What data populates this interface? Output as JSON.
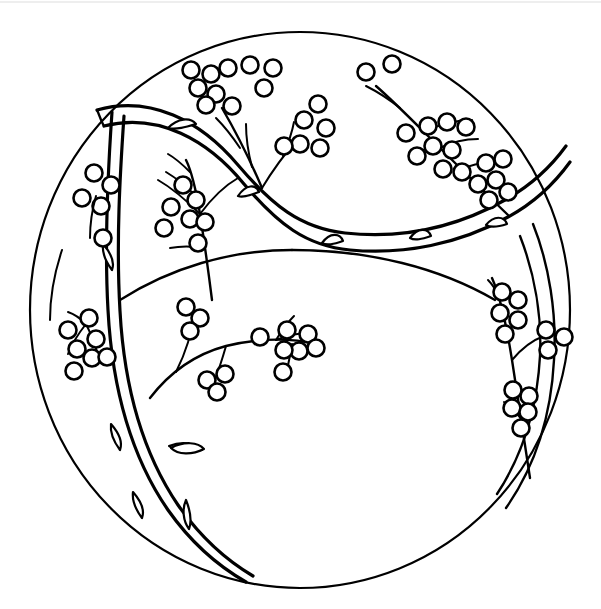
{
  "document": {
    "kind": "coloring-page-line-art",
    "title": "Berry Branch Mandala Circle",
    "width": 601,
    "height": 609,
    "background_color": "#ffffff",
    "ink_color": "#000000",
    "top_edge_color": "#e9e9e9"
  },
  "artwork": {
    "frame": {
      "shape": "circle",
      "center_x": 300,
      "center_y": 310,
      "radius_x": 270,
      "radius_y": 278,
      "stroke_width": 2.2
    },
    "description": "A large outlined circle divided by a sweeping double-line S-curved vine. Slender branches bearing clusters of small open-circle berries radiate across the three resulting regions.",
    "motifs": [
      {
        "name": "outer-circle",
        "count": 1
      },
      {
        "name": "s-curve-vine",
        "count": 1
      },
      {
        "name": "inner-arc-vine",
        "count": 2
      },
      {
        "name": "berry-branch",
        "count": 8
      },
      {
        "name": "berry",
        "count": 92
      },
      {
        "name": "thorn-spur",
        "count": 7
      },
      {
        "name": "leaf",
        "count": 3
      }
    ],
    "berry_radius": 8.5,
    "regions": [
      {
        "name": "upper-region",
        "label": "top band above the S-vine"
      },
      {
        "name": "left-region",
        "label": "left crescent between vine and rim"
      },
      {
        "name": "lower-region",
        "label": "large lower area below the S-vine"
      }
    ]
  },
  "chart_data": {
    "type": "scatter",
    "xlabel": "",
    "ylabel": "",
    "xlim": [
      0,
      601
    ],
    "ylim": [
      0,
      609
    ],
    "grid": false,
    "legend": "none",
    "series": [
      {
        "name": "berry-clusters",
        "values": [
          {
            "cluster": "upper-left-cluster",
            "x": 210,
            "y": 75,
            "berries": 7
          },
          {
            "cluster": "upper-mid-cluster",
            "x": 262,
            "y": 68,
            "berries": 3
          },
          {
            "cluster": "upper-center-cluster",
            "x": 312,
            "y": 128,
            "berries": 6
          },
          {
            "cluster": "upper-right-pair",
            "x": 370,
            "y": 67,
            "berries": 2
          },
          {
            "cluster": "right-upper-cluster",
            "x": 430,
            "y": 135,
            "berries": 8
          },
          {
            "cluster": "right-edge-cluster",
            "x": 492,
            "y": 178,
            "berries": 6
          },
          {
            "cluster": "left-top-cluster",
            "x": 93,
            "y": 180,
            "berries": 4
          },
          {
            "cluster": "left-mid-cluster",
            "x": 185,
            "y": 200,
            "berries": 7
          },
          {
            "cluster": "left-low-cluster",
            "x": 80,
            "y": 345,
            "berries": 7
          },
          {
            "cluster": "center-left-cluster",
            "x": 190,
            "y": 315,
            "berries": 4
          },
          {
            "cluster": "center-cluster",
            "x": 220,
            "y": 380,
            "berries": 3
          },
          {
            "cluster": "center-right-cluster",
            "x": 290,
            "y": 345,
            "berries": 7
          },
          {
            "cluster": "right-mid-cluster",
            "x": 510,
            "y": 300,
            "berries": 7
          },
          {
            "cluster": "right-low-cluster",
            "x": 548,
            "y": 345,
            "berries": 4
          },
          {
            "cluster": "right-bottom-cluster",
            "x": 520,
            "y": 400,
            "berries": 5
          }
        ]
      }
    ]
  }
}
